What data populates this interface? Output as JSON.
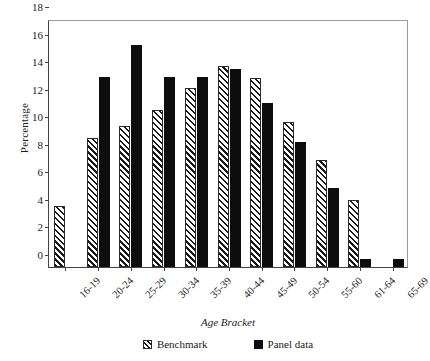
{
  "chart_data": {
    "type": "bar",
    "title": "",
    "xlabel": "Age Bracket",
    "ylabel": "Percentage",
    "ylim": [
      0,
      18
    ],
    "ytick_step": 2,
    "yticks": [
      0,
      2,
      4,
      6,
      8,
      10,
      12,
      14,
      16,
      18
    ],
    "grid": false,
    "legend_position": "bottom",
    "categories": [
      "16-19",
      "20-24",
      "25-29",
      "30-34",
      "35-39",
      "40-44",
      "45-49",
      "50-54",
      "55-60",
      "61-64",
      "65-69"
    ],
    "series": [
      {
        "name": "Benchmark",
        "style": "hatched",
        "color": "#ffffff",
        "values": [
          4.4,
          9.4,
          10.2,
          11.4,
          13.0,
          14.6,
          13.7,
          10.5,
          7.8,
          4.9,
          0
        ]
      },
      {
        "name": "Panel data",
        "style": "solid",
        "color": "#0d0d0d",
        "values": [
          0,
          13.8,
          16.1,
          13.8,
          13.8,
          14.4,
          11.9,
          9.1,
          5.7,
          0.6,
          0.6
        ]
      }
    ]
  },
  "legend": {
    "items": [
      {
        "label": "Benchmark",
        "swatch": "hatched-swatch-icon"
      },
      {
        "label": "Panel data",
        "swatch": "solid-swatch-icon"
      }
    ]
  },
  "axes": {
    "y_title": "Percentage",
    "x_title": "Age Bracket"
  }
}
